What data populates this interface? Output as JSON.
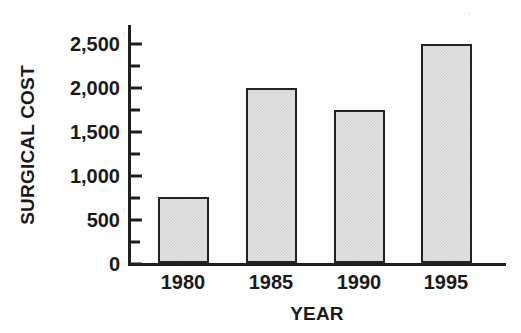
{
  "chart_data": {
    "type": "bar",
    "title": "",
    "categories": [
      "1980",
      "1985",
      "1990",
      "1995"
    ],
    "values": [
      750,
      2000,
      1750,
      2500
    ],
    "xlabel": "YEAR",
    "ylabel": "SURGICAL COST",
    "ylim": [
      0,
      2500
    ],
    "ytick_values": [
      0,
      500,
      1000,
      1500,
      2000,
      2500
    ],
    "ytick_labels": [
      "0",
      "500",
      "1,000",
      "1,500",
      "2,000",
      "2,500"
    ],
    "yminor_tick_values": [
      250,
      750,
      1250,
      1750,
      2250
    ],
    "grid": false,
    "legend": null,
    "series": [
      {
        "name": "Surgical cost",
        "values": [
          750,
          2000,
          1750,
          2500
        ]
      }
    ],
    "bar_fill_color": "#e3e3e3",
    "bar_edge_color": "#232323",
    "axis_color": "#1f1f1f",
    "background_color": "#ffffff"
  }
}
